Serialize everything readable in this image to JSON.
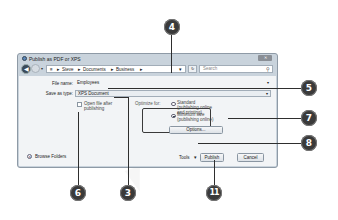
{
  "dialog": {
    "title": "Publish as PDF or XPS",
    "close_label": "✕",
    "nav": {
      "back_icon": "◀",
      "history_icon": "▾",
      "path": [
        "≡",
        "Steve",
        "Documents",
        "Business"
      ],
      "path_separator": "▸",
      "path_dropdown": "▾",
      "refresh_icon": "↻",
      "search_placeholder": "Search",
      "search_icon": "⚲"
    },
    "file_name_label": "File name:",
    "file_name_value": "Employees",
    "save_type_label": "Save as type:",
    "save_type_value": "XPS Document",
    "dropdown_icon": "▾",
    "open_after_label": "Open file after publishing",
    "open_after_checked": false,
    "optimize_label": "Optimize for:",
    "optimize_options": [
      {
        "label": "Standard (publishing online and printing)",
        "selected": false
      },
      {
        "label": "Minimum size (publishing online)",
        "selected": true
      }
    ],
    "options_button": "Options...",
    "browse_folders": "Browse Folders",
    "browse_icon": "▾",
    "tools_label": "Tools",
    "tools_icon": "▾",
    "publish_button": "Publish",
    "cancel_button": "Cancel"
  },
  "callouts": {
    "c4": "4",
    "c5": "5",
    "c7": "7",
    "c8": "8",
    "c6": "6",
    "c3": "3",
    "c11": "11"
  }
}
